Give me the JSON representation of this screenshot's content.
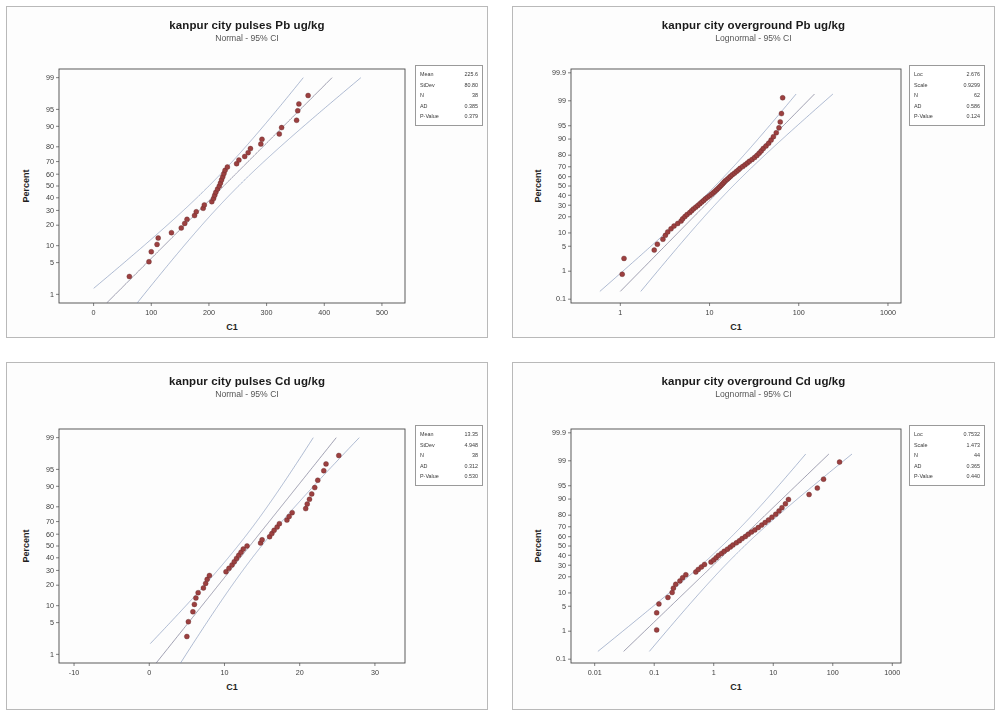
{
  "page": {
    "background": "#ffffff",
    "panel_border": "#b9b9b9",
    "point_color": "#9c4040",
    "ci_color": "#7b8fb5",
    "fit_color": "#6f6f8a"
  },
  "chart_data": [
    {
      "id": "pulses-pb",
      "type": "scatter",
      "title": "kanpur city pulses Pb ug/kg",
      "subtitle": "Normal - 95% CI",
      "distribution": "Normal",
      "ci": "95%",
      "xlabel": "C1",
      "ylabel": "Percent",
      "xscale": "linear",
      "yscale": "probit",
      "xticks": [
        0,
        100,
        200,
        300,
        400,
        500
      ],
      "xticklabels": [
        "0",
        "100",
        "200",
        "300",
        "400",
        "500"
      ],
      "xlim": [
        -60,
        540
      ],
      "yticks": [
        1,
        5,
        10,
        20,
        30,
        40,
        50,
        60,
        70,
        80,
        90,
        95,
        99
      ],
      "yticklabels": [
        "1",
        "5",
        "10",
        "20",
        "30",
        "40",
        "50",
        "60",
        "70",
        "80",
        "90",
        "95",
        "99"
      ],
      "ylim": [
        0.6,
        99.4
      ],
      "stats": [
        {
          "label": "Mean",
          "value": "225.6"
        },
        {
          "label": "StDev",
          "value": "80.80"
        },
        {
          "label": "N",
          "value": "38"
        },
        {
          "label": "AD",
          "value": "0.385"
        },
        {
          "label": "P-Value",
          "value": "0.379"
        }
      ],
      "points": [
        {
          "x": 62,
          "p": 2.6
        },
        {
          "x": 96,
          "p": 5.2
        },
        {
          "x": 100,
          "p": 7.9
        },
        {
          "x": 110,
          "p": 10.5
        },
        {
          "x": 112,
          "p": 13.2
        },
        {
          "x": 135,
          "p": 15.8
        },
        {
          "x": 152,
          "p": 18.4
        },
        {
          "x": 158,
          "p": 21.1
        },
        {
          "x": 162,
          "p": 23.7
        },
        {
          "x": 175,
          "p": 26.3
        },
        {
          "x": 178,
          "p": 29.0
        },
        {
          "x": 190,
          "p": 31.6
        },
        {
          "x": 192,
          "p": 34.2
        },
        {
          "x": 205,
          "p": 36.8
        },
        {
          "x": 208,
          "p": 39.5
        },
        {
          "x": 210,
          "p": 42.1
        },
        {
          "x": 212,
          "p": 44.7
        },
        {
          "x": 215,
          "p": 47.4
        },
        {
          "x": 218,
          "p": 50.0
        },
        {
          "x": 220,
          "p": 52.6
        },
        {
          "x": 222,
          "p": 55.3
        },
        {
          "x": 224,
          "p": 57.9
        },
        {
          "x": 226,
          "p": 60.5
        },
        {
          "x": 228,
          "p": 63.2
        },
        {
          "x": 232,
          "p": 65.8
        },
        {
          "x": 248,
          "p": 68.4
        },
        {
          "x": 252,
          "p": 71.1
        },
        {
          "x": 262,
          "p": 73.7
        },
        {
          "x": 268,
          "p": 76.3
        },
        {
          "x": 272,
          "p": 78.9
        },
        {
          "x": 290,
          "p": 81.6
        },
        {
          "x": 292,
          "p": 84.2
        },
        {
          "x": 322,
          "p": 86.8
        },
        {
          "x": 326,
          "p": 89.5
        },
        {
          "x": 352,
          "p": 92.1
        },
        {
          "x": 354,
          "p": 94.7
        },
        {
          "x": 356,
          "p": 96.1
        },
        {
          "x": 372,
          "p": 97.4
        }
      ]
    },
    {
      "id": "overground-pb",
      "type": "scatter",
      "title": "kanpur city overground Pb ug/kg",
      "subtitle": "Lognormal - 95% CI",
      "distribution": "Lognormal",
      "ci": "95%",
      "xlabel": "C1",
      "ylabel": "Percent",
      "xscale": "log",
      "yscale": "probit",
      "xticks": [
        1,
        10,
        100,
        1000
      ],
      "xticklabels": [
        "1",
        "10",
        "100",
        "1000"
      ],
      "xlim": [
        0.28,
        1400
      ],
      "yticks": [
        0.1,
        1,
        5,
        10,
        20,
        30,
        40,
        50,
        60,
        70,
        80,
        90,
        95,
        99,
        99.9
      ],
      "yticklabels": [
        "0.1",
        "1",
        "5",
        "10",
        "20",
        "30",
        "40",
        "50",
        "60",
        "70",
        "80",
        "90",
        "95",
        "99",
        "99.9"
      ],
      "ylim": [
        0.07,
        99.93
      ],
      "stats": [
        {
          "label": "Loc",
          "value": "2.676"
        },
        {
          "label": "Scale",
          "value": "0.9299"
        },
        {
          "label": "N",
          "value": "62"
        },
        {
          "label": "AD",
          "value": "0.586"
        },
        {
          "label": "P-Value",
          "value": "0.124"
        }
      ],
      "points": [
        {
          "x": 1.05,
          "p": 0.8
        },
        {
          "x": 1.1,
          "p": 2.4
        },
        {
          "x": 2.4,
          "p": 4.0
        },
        {
          "x": 2.6,
          "p": 5.6
        },
        {
          "x": 3.0,
          "p": 7.3
        },
        {
          "x": 3.2,
          "p": 8.9
        },
        {
          "x": 3.4,
          "p": 10.5
        },
        {
          "x": 3.7,
          "p": 12.1
        },
        {
          "x": 4.0,
          "p": 13.7
        },
        {
          "x": 4.4,
          "p": 15.3
        },
        {
          "x": 4.8,
          "p": 16.9
        },
        {
          "x": 5.0,
          "p": 18.5
        },
        {
          "x": 5.3,
          "p": 20.2
        },
        {
          "x": 5.6,
          "p": 21.8
        },
        {
          "x": 6.0,
          "p": 23.4
        },
        {
          "x": 6.3,
          "p": 25.0
        },
        {
          "x": 6.6,
          "p": 26.6
        },
        {
          "x": 7.0,
          "p": 28.2
        },
        {
          "x": 7.4,
          "p": 29.8
        },
        {
          "x": 7.8,
          "p": 31.5
        },
        {
          "x": 8.2,
          "p": 33.1
        },
        {
          "x": 8.6,
          "p": 34.7
        },
        {
          "x": 9.0,
          "p": 36.3
        },
        {
          "x": 9.5,
          "p": 37.9
        },
        {
          "x": 10.0,
          "p": 39.5
        },
        {
          "x": 10.5,
          "p": 41.1
        },
        {
          "x": 11.0,
          "p": 42.7
        },
        {
          "x": 11.5,
          "p": 44.4
        },
        {
          "x": 12.0,
          "p": 46.0
        },
        {
          "x": 12.5,
          "p": 47.6
        },
        {
          "x": 13.0,
          "p": 49.2
        },
        {
          "x": 13.5,
          "p": 50.8
        },
        {
          "x": 14.0,
          "p": 52.4
        },
        {
          "x": 14.5,
          "p": 54.0
        },
        {
          "x": 15.0,
          "p": 55.6
        },
        {
          "x": 15.8,
          "p": 57.3
        },
        {
          "x": 16.5,
          "p": 58.9
        },
        {
          "x": 17.2,
          "p": 60.5
        },
        {
          "x": 18.0,
          "p": 62.1
        },
        {
          "x": 19.0,
          "p": 63.7
        },
        {
          "x": 20.0,
          "p": 65.3
        },
        {
          "x": 21.0,
          "p": 66.9
        },
        {
          "x": 22.0,
          "p": 68.5
        },
        {
          "x": 23.5,
          "p": 70.2
        },
        {
          "x": 25.0,
          "p": 71.8
        },
        {
          "x": 26.5,
          "p": 73.4
        },
        {
          "x": 28.0,
          "p": 75.0
        },
        {
          "x": 30.0,
          "p": 76.6
        },
        {
          "x": 32.0,
          "p": 78.2
        },
        {
          "x": 34.0,
          "p": 79.8
        },
        {
          "x": 36.0,
          "p": 81.5
        },
        {
          "x": 38.0,
          "p": 83.1
        },
        {
          "x": 40.0,
          "p": 84.7
        },
        {
          "x": 43.0,
          "p": 86.3
        },
        {
          "x": 46.0,
          "p": 87.9
        },
        {
          "x": 49.0,
          "p": 89.5
        },
        {
          "x": 52.0,
          "p": 91.1
        },
        {
          "x": 56.0,
          "p": 92.7
        },
        {
          "x": 60.0,
          "p": 94.4
        },
        {
          "x": 62.0,
          "p": 96.0
        },
        {
          "x": 64.0,
          "p": 97.6
        },
        {
          "x": 66.0,
          "p": 99.2
        }
      ]
    },
    {
      "id": "pulses-cd",
      "type": "scatter",
      "title": "kanpur city pulses Cd ug/kg",
      "subtitle": "Normal - 95% CI",
      "distribution": "Normal",
      "ci": "95%",
      "xlabel": "C1",
      "ylabel": "Percent",
      "xscale": "linear",
      "yscale": "probit",
      "xticks": [
        -10,
        0,
        10,
        20,
        30
      ],
      "xticklabels": [
        "-10",
        "0",
        "10",
        "20",
        "30"
      ],
      "xlim": [
        -12,
        34
      ],
      "yticks": [
        1,
        5,
        10,
        20,
        30,
        40,
        50,
        60,
        70,
        80,
        90,
        95,
        99
      ],
      "yticklabels": [
        "1",
        "5",
        "10",
        "20",
        "30",
        "40",
        "50",
        "60",
        "70",
        "80",
        "90",
        "95",
        "99"
      ],
      "ylim": [
        0.6,
        99.4
      ],
      "stats": [
        {
          "label": "Mean",
          "value": "13.35"
        },
        {
          "label": "StDev",
          "value": "4.948"
        },
        {
          "label": "N",
          "value": "38"
        },
        {
          "label": "AD",
          "value": "0.312"
        },
        {
          "label": "P-Value",
          "value": "0.530"
        }
      ],
      "points": [
        {
          "x": 5.0,
          "p": 2.6
        },
        {
          "x": 5.2,
          "p": 5.2
        },
        {
          "x": 5.8,
          "p": 7.9
        },
        {
          "x": 6.0,
          "p": 10.5
        },
        {
          "x": 6.2,
          "p": 13.2
        },
        {
          "x": 6.5,
          "p": 15.8
        },
        {
          "x": 7.2,
          "p": 18.4
        },
        {
          "x": 7.5,
          "p": 21.1
        },
        {
          "x": 7.7,
          "p": 23.7
        },
        {
          "x": 8.0,
          "p": 26.3
        },
        {
          "x": 10.2,
          "p": 29.0
        },
        {
          "x": 10.6,
          "p": 31.6
        },
        {
          "x": 11.0,
          "p": 34.2
        },
        {
          "x": 11.3,
          "p": 36.8
        },
        {
          "x": 11.6,
          "p": 39.5
        },
        {
          "x": 11.9,
          "p": 42.1
        },
        {
          "x": 12.2,
          "p": 44.7
        },
        {
          "x": 12.5,
          "p": 47.4
        },
        {
          "x": 13.0,
          "p": 50.0
        },
        {
          "x": 14.8,
          "p": 52.6
        },
        {
          "x": 15.0,
          "p": 55.3
        },
        {
          "x": 16.0,
          "p": 57.9
        },
        {
          "x": 16.3,
          "p": 60.5
        },
        {
          "x": 16.6,
          "p": 63.2
        },
        {
          "x": 17.0,
          "p": 65.8
        },
        {
          "x": 17.3,
          "p": 68.4
        },
        {
          "x": 18.3,
          "p": 71.1
        },
        {
          "x": 18.6,
          "p": 73.7
        },
        {
          "x": 19.0,
          "p": 76.3
        },
        {
          "x": 20.8,
          "p": 78.9
        },
        {
          "x": 21.0,
          "p": 81.6
        },
        {
          "x": 21.3,
          "p": 84.2
        },
        {
          "x": 21.6,
          "p": 86.8
        },
        {
          "x": 22.0,
          "p": 89.5
        },
        {
          "x": 22.4,
          "p": 92.1
        },
        {
          "x": 23.2,
          "p": 94.7
        },
        {
          "x": 23.5,
          "p": 96.1
        },
        {
          "x": 25.2,
          "p": 97.4
        }
      ]
    },
    {
      "id": "overground-cd",
      "type": "scatter",
      "title": "kanpur city overground Cd ug/kg",
      "subtitle": "Lognormal - 95% CI",
      "distribution": "Lognormal",
      "ci": "95%",
      "xlabel": "C1",
      "ylabel": "Percent",
      "xscale": "log",
      "yscale": "probit",
      "xticks": [
        0.01,
        0.1,
        1,
        10,
        100,
        1000
      ],
      "xticklabels": [
        "0.01",
        "0.1",
        "1",
        "10",
        "100",
        "1000"
      ],
      "xlim": [
        0.004,
        1400
      ],
      "yticks": [
        0.1,
        1,
        5,
        10,
        20,
        30,
        40,
        50,
        60,
        70,
        80,
        90,
        95,
        99,
        99.9
      ],
      "yticklabels": [
        "0.1",
        "1",
        "5",
        "10",
        "20",
        "30",
        "40",
        "50",
        "60",
        "70",
        "80",
        "90",
        "95",
        "99",
        "99.9"
      ],
      "ylim": [
        0.07,
        99.93
      ],
      "stats": [
        {
          "label": "Loc",
          "value": "0.7532"
        },
        {
          "label": "Scale",
          "value": "1.473"
        },
        {
          "label": "N",
          "value": "44"
        },
        {
          "label": "AD",
          "value": "0.365"
        },
        {
          "label": "P-Value",
          "value": "0.440"
        }
      ],
      "points": [
        {
          "x": 0.11,
          "p": 1.1
        },
        {
          "x": 0.11,
          "p": 3.4
        },
        {
          "x": 0.12,
          "p": 5.7
        },
        {
          "x": 0.17,
          "p": 8.0
        },
        {
          "x": 0.2,
          "p": 10.2
        },
        {
          "x": 0.21,
          "p": 12.5
        },
        {
          "x": 0.23,
          "p": 14.8
        },
        {
          "x": 0.27,
          "p": 17.0
        },
        {
          "x": 0.3,
          "p": 19.3
        },
        {
          "x": 0.34,
          "p": 21.6
        },
        {
          "x": 0.5,
          "p": 23.9
        },
        {
          "x": 0.55,
          "p": 26.1
        },
        {
          "x": 0.62,
          "p": 28.4
        },
        {
          "x": 0.7,
          "p": 30.7
        },
        {
          "x": 0.9,
          "p": 33.0
        },
        {
          "x": 1.0,
          "p": 35.2
        },
        {
          "x": 1.1,
          "p": 37.5
        },
        {
          "x": 1.2,
          "p": 39.8
        },
        {
          "x": 1.35,
          "p": 42.0
        },
        {
          "x": 1.5,
          "p": 44.3
        },
        {
          "x": 1.7,
          "p": 46.6
        },
        {
          "x": 1.9,
          "p": 48.9
        },
        {
          "x": 2.1,
          "p": 51.1
        },
        {
          "x": 2.4,
          "p": 53.4
        },
        {
          "x": 2.7,
          "p": 55.7
        },
        {
          "x": 3.0,
          "p": 58.0
        },
        {
          "x": 3.4,
          "p": 60.2
        },
        {
          "x": 3.8,
          "p": 62.5
        },
        {
          "x": 4.3,
          "p": 64.8
        },
        {
          "x": 4.9,
          "p": 67.0
        },
        {
          "x": 5.6,
          "p": 69.3
        },
        {
          "x": 6.4,
          "p": 71.6
        },
        {
          "x": 7.3,
          "p": 73.9
        },
        {
          "x": 8.3,
          "p": 76.1
        },
        {
          "x": 9.5,
          "p": 78.4
        },
        {
          "x": 11.0,
          "p": 80.7
        },
        {
          "x": 12.5,
          "p": 83.0
        },
        {
          "x": 14.0,
          "p": 85.2
        },
        {
          "x": 16.0,
          "p": 87.5
        },
        {
          "x": 18.0,
          "p": 89.8
        },
        {
          "x": 40.0,
          "p": 92.0
        },
        {
          "x": 55.0,
          "p": 94.3
        },
        {
          "x": 70.0,
          "p": 96.6
        },
        {
          "x": 130.0,
          "p": 98.9
        }
      ]
    }
  ]
}
